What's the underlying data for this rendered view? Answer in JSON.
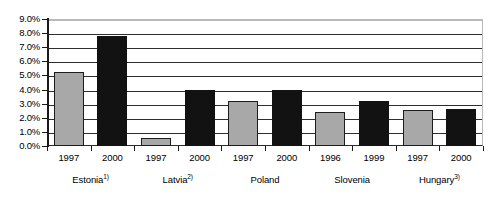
{
  "chart_data": {
    "type": "bar",
    "title": "",
    "subtitle": "",
    "xlabel": "",
    "ylabel": "",
    "ylim": [
      0,
      9
    ],
    "yunit": "%",
    "grid": true,
    "legend": "none",
    "ytick_labels": [
      "9.0%",
      "8.0%",
      "7.0%",
      "6.0%",
      "5.0%",
      "4.0%",
      "3.0%",
      "2.0%",
      "1.0%",
      "0.0%"
    ],
    "ytick_values": [
      9.0,
      8.0,
      7.0,
      6.0,
      5.0,
      4.0,
      3.0,
      2.0,
      1.0,
      0.0
    ],
    "groups": [
      {
        "name": "Estonia",
        "footnote": "1)",
        "bars": [
          {
            "year": "1997",
            "value": 5.25,
            "color": "#a8a8a8",
            "style": "gray"
          },
          {
            "year": "2000",
            "value": 7.8,
            "color": "#121212",
            "style": "black"
          }
        ]
      },
      {
        "name": "Latvia",
        "footnote": "2)",
        "bars": [
          {
            "year": "1997",
            "value": 0.55,
            "color": "#a8a8a8",
            "style": "gray"
          },
          {
            "year": "2000",
            "value": 4.0,
            "color": "#121212",
            "style": "black"
          }
        ]
      },
      {
        "name": "Poland",
        "footnote": "",
        "bars": [
          {
            "year": "1997",
            "value": 3.2,
            "color": "#a8a8a8",
            "style": "gray"
          },
          {
            "year": "2000",
            "value": 3.95,
            "color": "#121212",
            "style": "black"
          }
        ]
      },
      {
        "name": "Slovenia",
        "footnote": "",
        "bars": [
          {
            "year": "1996",
            "value": 2.4,
            "color": "#a8a8a8",
            "style": "gray"
          },
          {
            "year": "1999",
            "value": 3.2,
            "color": "#121212",
            "style": "black"
          }
        ]
      },
      {
        "name": "Hungary",
        "footnote": "3)",
        "bars": [
          {
            "year": "1997",
            "value": 2.55,
            "color": "#a8a8a8",
            "style": "gray"
          },
          {
            "year": "2000",
            "value": 2.65,
            "color": "#121212",
            "style": "black"
          }
        ]
      }
    ],
    "colors": {
      "series_gray": "#a8a8a8",
      "series_black": "#121212",
      "gridline": "#2e2e2e",
      "axis": "#1a1a1a",
      "background": "#ffffff"
    }
  }
}
